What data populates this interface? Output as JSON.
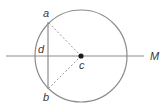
{
  "figure": {
    "background_color": "#ffffff",
    "stroke_color": "#8c8c8c",
    "dashed_color": "#9a9a9a",
    "label_color": "#3a3a3a",
    "width": 168,
    "height": 106
  },
  "circle": {
    "name": "circle",
    "center_x": 81,
    "center_y": 56,
    "radius": 46
  },
  "center_point": {
    "name": "center-point",
    "x": 81,
    "y": 56,
    "radius": 2.6,
    "label": "c",
    "label_x": 79,
    "label_y": 69
  },
  "diameter_line": {
    "name": "diameter-line",
    "x1": 6,
    "y1": 56,
    "x2": 144,
    "y2": 56,
    "end_label": "M",
    "end_label_x": 150,
    "end_label_y": 60
  },
  "chord": {
    "name": "chord-ab",
    "x1": 48,
    "y1": 22,
    "x2": 48,
    "y2": 89
  },
  "points": [
    {
      "name": "point-a",
      "label": "a",
      "x": 48,
      "y": 22,
      "label_x": 43,
      "label_y": 17
    },
    {
      "name": "point-d",
      "label": "d",
      "x": 48,
      "y": 56,
      "label_x": 38,
      "label_y": 53
    },
    {
      "name": "point-b",
      "label": "b",
      "x": 48,
      "y": 89,
      "label_x": 43,
      "label_y": 101
    }
  ],
  "radii": [
    {
      "name": "radius-c-a",
      "x1": 81,
      "y1": 56,
      "x2": 48,
      "y2": 22
    },
    {
      "name": "radius-c-b",
      "x1": 81,
      "y1": 56,
      "x2": 48,
      "y2": 89
    }
  ],
  "labels": {
    "a": "a",
    "b": "b",
    "c": "c",
    "d": "d",
    "M": "M"
  }
}
